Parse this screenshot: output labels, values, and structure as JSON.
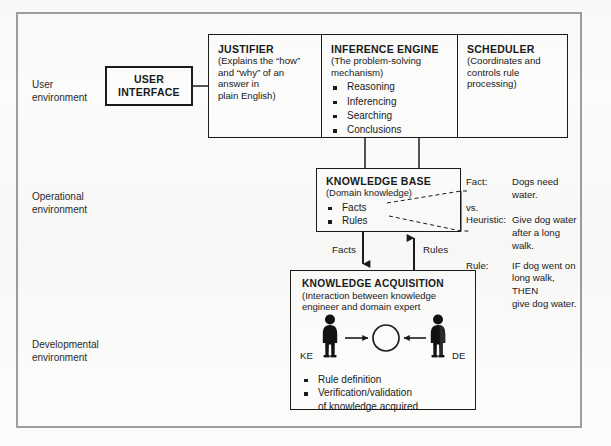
{
  "diagram": {
    "environments": [
      {
        "id": "user",
        "label": "User\nenvironment"
      },
      {
        "id": "operational",
        "label": "Operational\nenvironment"
      },
      {
        "id": "developmental",
        "label": "Developmental\n environment"
      }
    ],
    "user_interface": {
      "title": "USER\nINTERFACE"
    },
    "top_row": [
      {
        "id": "justifier",
        "title": "JUSTIFIER",
        "subtitle": "(Explains the “how” and “why” of an answer in\nplain English)",
        "bullets": []
      },
      {
        "id": "inference-engine",
        "title": "INFERENCE ENGINE",
        "subtitle": "(The problem-solving\nmechanism)",
        "bullets": [
          "Reasoning",
          "Inferencing",
          "Searching",
          "Conclusions"
        ]
      },
      {
        "id": "scheduler",
        "title": "SCHEDULER",
        "subtitle": "(Coordinates and\ncontrols rule\nprocessing)",
        "bullets": []
      }
    ],
    "knowledge_base": {
      "title": "KNOWLEDGE BASE",
      "subtitle": "(Domain knowledge)",
      "bullets": [
        "Facts",
        "Rules"
      ]
    },
    "knowledge_acquisition": {
      "title": "KNOWLEDGE ACQUISITION",
      "subtitle": "(Interaction between knowledge\nengineer and domain expert",
      "bullets": [
        "Rule definition",
        "Verification/validation\nof knowledge acquired"
      ],
      "actor_left_label": "KE",
      "actor_right_label": "DE"
    },
    "flow_labels": {
      "facts": "Facts",
      "rules": "Rules"
    },
    "annotations": [
      {
        "key": "Fact:",
        "value": "Dogs need water."
      },
      {
        "key": "vs.",
        "value": ""
      },
      {
        "key": "Heuristic:",
        "value": "Give dog water\nafter a long walk."
      },
      {
        "key": "Rule:",
        "value": "IF dog went on\nlong walk, THEN\ngive dog water."
      }
    ],
    "colors": {
      "ink": "#1b1b1b",
      "frame": "#9d9d9d",
      "page": "#fbfbfa"
    }
  }
}
